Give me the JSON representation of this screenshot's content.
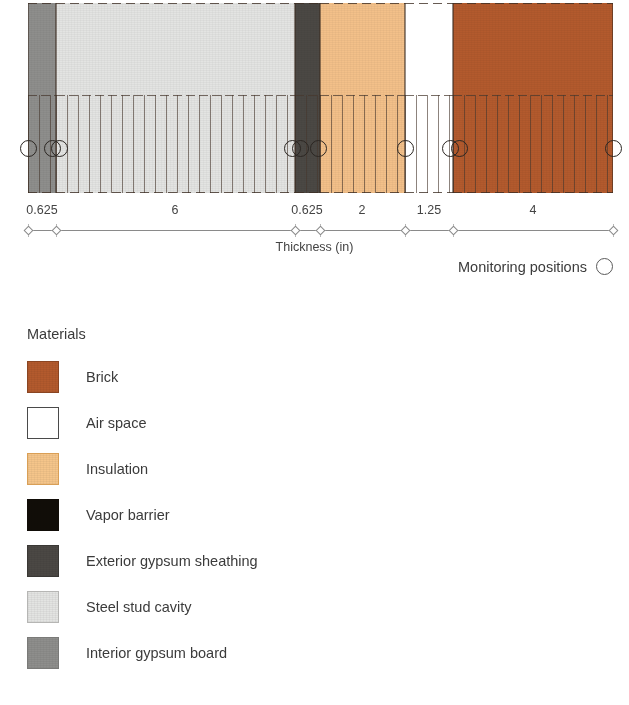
{
  "chart_data": {
    "type": "bar",
    "title": "",
    "xlabel": "Thickness (in)",
    "ylabel": "",
    "orientation": "horizontal-stack",
    "categories": [
      "Interior gypsum board",
      "Steel stud cavity",
      "Exterior gypsum sheathing",
      "Insulation",
      "Air space",
      "Brick"
    ],
    "values": [
      0.625,
      6,
      0.625,
      2,
      1.25,
      4
    ],
    "units": "in",
    "total_thickness": 14.5,
    "tick_labels": [
      "0.625",
      "6",
      "0.625",
      "2",
      "1.25",
      "4"
    ],
    "cumulative_boundaries": [
      0,
      0.625,
      6.625,
      7.25,
      9.25,
      10.5,
      14.5
    ],
    "legend_position": "below-left",
    "grid": false
  },
  "wall": {
    "order_description": "interior (left) to exterior (right)",
    "layers": [
      {
        "id": "interior-gypsum-board",
        "name": "Interior gypsum board",
        "thickness": 0.625,
        "color": "#8e8e8c",
        "hatched": true,
        "x0": 28,
        "x1": 56
      },
      {
        "id": "steel-stud-cavity",
        "name": "Steel stud cavity",
        "thickness": 6,
        "color": "#e3e4e2",
        "hatched": true,
        "x0": 56,
        "x1": 295
      },
      {
        "id": "exterior-gypsum-sheathing",
        "name": "Exterior gypsum sheathing",
        "thickness": 0.625,
        "color": "#4b4844",
        "hatched": true,
        "x0": 295,
        "x1": 320
      },
      {
        "id": "insulation",
        "name": "Insulation",
        "thickness": 2,
        "color": "#f3c089",
        "hatched": true,
        "x0": 320,
        "x1": 405
      },
      {
        "id": "air-space",
        "name": "Air space",
        "thickness": 1.25,
        "color": "#ffffff",
        "hatched": true,
        "x0": 405,
        "x1": 453
      },
      {
        "id": "brick",
        "name": "Brick",
        "thickness": 4,
        "color": "#b35a2d",
        "hatched": true,
        "x0": 453,
        "x1": 613
      }
    ]
  },
  "axis": {
    "title": "Thickness (in)",
    "ticks": [
      {
        "label": "",
        "x": 28
      },
      {
        "label": "",
        "x": 56
      },
      {
        "label": "",
        "x": 295
      },
      {
        "label": "",
        "x": 320
      },
      {
        "label": "",
        "x": 405
      },
      {
        "label": "",
        "x": 453
      },
      {
        "label": "",
        "x": 613
      }
    ],
    "dimension_labels": [
      {
        "text": "0.625",
        "x": 42
      },
      {
        "text": "6",
        "x": 175
      },
      {
        "text": "0.625",
        "x": 307
      },
      {
        "text": "2",
        "x": 362
      },
      {
        "text": "1.25",
        "x": 429
      },
      {
        "text": "4",
        "x": 533
      }
    ]
  },
  "monitoring": {
    "key_label": "Monitoring positions",
    "marker": "open-circle",
    "positions_px": [
      28,
      52,
      59,
      292,
      300,
      318,
      405,
      450,
      459,
      613
    ]
  },
  "legend": {
    "title": "Materials",
    "items": [
      {
        "label": "Brick",
        "color": "#b35a2d",
        "border": "#8a4522"
      },
      {
        "label": "Air space",
        "color": "#ffffff",
        "border": "#4a4a4a"
      },
      {
        "label": "Insulation",
        "color": "#f5c58a",
        "border": "#d99f56"
      },
      {
        "label": "Vapor barrier",
        "color": "#110d08",
        "border": "#110d08"
      },
      {
        "label": "Exterior gypsum sheathing",
        "color": "#4b4844",
        "border": "#3a3835"
      },
      {
        "label": "Steel stud cavity",
        "color": "#e3e4e2",
        "border": "#b6b6b4"
      },
      {
        "label": "Interior gypsum board",
        "color": "#8e8e8c",
        "border": "#7a7a78"
      }
    ]
  }
}
